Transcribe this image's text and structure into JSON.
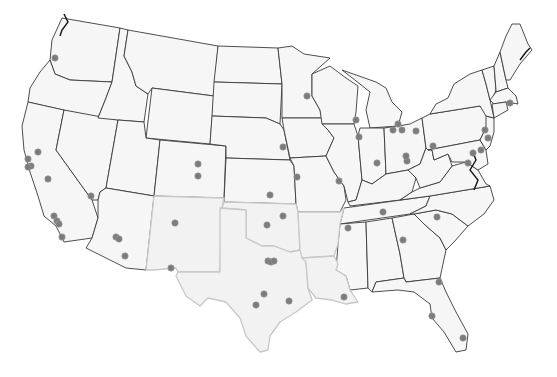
{
  "map": {
    "title": "",
    "region": "Contiguous United States",
    "colors": {
      "background": "#ffffff",
      "land": "#f6f6f6",
      "border": "#3a3a3a",
      "highlight_border": "#c8c8c8",
      "dot": "#7c7c7c"
    },
    "highlighted_states": [
      "Texas",
      "Oklahoma",
      "New Mexico",
      "Arkansas",
      "Louisiana"
    ],
    "points": [
      {
        "x": 55,
        "y": 58
      },
      {
        "x": 38,
        "y": 152
      },
      {
        "x": 28,
        "y": 159
      },
      {
        "x": 31,
        "y": 166
      },
      {
        "x": 28,
        "y": 167
      },
      {
        "x": 48,
        "y": 179
      },
      {
        "x": 91,
        "y": 196
      },
      {
        "x": 54,
        "y": 216
      },
      {
        "x": 57,
        "y": 221
      },
      {
        "x": 59,
        "y": 224
      },
      {
        "x": 62,
        "y": 237
      },
      {
        "x": 116,
        "y": 237
      },
      {
        "x": 119,
        "y": 239
      },
      {
        "x": 125,
        "y": 256
      },
      {
        "x": 175,
        "y": 223
      },
      {
        "x": 171,
        "y": 268
      },
      {
        "x": 198,
        "y": 164
      },
      {
        "x": 198,
        "y": 176
      },
      {
        "x": 270,
        "y": 195
      },
      {
        "x": 267,
        "y": 225
      },
      {
        "x": 283,
        "y": 216
      },
      {
        "x": 268,
        "y": 261
      },
      {
        "x": 271,
        "y": 262
      },
      {
        "x": 274,
        "y": 261
      },
      {
        "x": 264,
        "y": 294
      },
      {
        "x": 256,
        "y": 305
      },
      {
        "x": 289,
        "y": 301
      },
      {
        "x": 307,
        "y": 96
      },
      {
        "x": 283,
        "y": 147
      },
      {
        "x": 297,
        "y": 177
      },
      {
        "x": 339,
        "y": 181
      },
      {
        "x": 344,
        "y": 297
      },
      {
        "x": 348,
        "y": 228
      },
      {
        "x": 356,
        "y": 120
      },
      {
        "x": 359,
        "y": 137
      },
      {
        "x": 377,
        "y": 163
      },
      {
        "x": 383,
        "y": 212
      },
      {
        "x": 393,
        "y": 130
      },
      {
        "x": 398,
        "y": 124
      },
      {
        "x": 402,
        "y": 130
      },
      {
        "x": 407,
        "y": 161
      },
      {
        "x": 416,
        "y": 131
      },
      {
        "x": 406,
        "y": 156
      },
      {
        "x": 433,
        "y": 146
      },
      {
        "x": 437,
        "y": 217
      },
      {
        "x": 403,
        "y": 240
      },
      {
        "x": 439,
        "y": 282
      },
      {
        "x": 432,
        "y": 316
      },
      {
        "x": 463,
        "y": 338
      },
      {
        "x": 473,
        "y": 153
      },
      {
        "x": 468,
        "y": 163
      },
      {
        "x": 481,
        "y": 150
      },
      {
        "x": 488,
        "y": 138
      },
      {
        "x": 485,
        "y": 130
      },
      {
        "x": 510,
        "y": 103
      }
    ]
  }
}
